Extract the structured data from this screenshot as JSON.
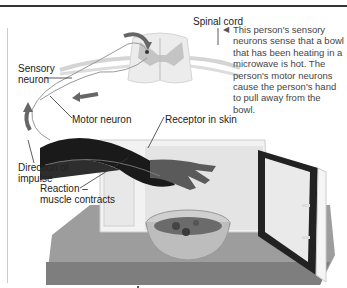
{
  "figure": {
    "labels": {
      "spinal_cord": "Spinal cord",
      "sensory_neuron_1": "Sensory",
      "sensory_neuron_2": "neuron",
      "motor_neuron": "Motor neuron",
      "receptor": "Receptor in skin",
      "direction_1": "Direction of",
      "direction_2": "impulse",
      "reaction_1": "Reaction –",
      "reaction_2": "muscle contracts"
    },
    "caption": {
      "pointer": "◀",
      "text": "This person's sensory neurons sense that a bowl that has been heating in a microwave is hot. The person's motor neurons cause the person's hand to pull away from the bowl."
    },
    "colors": {
      "rule": "#333333",
      "spinal_grey": "#c8c8c8",
      "spinal_white": "#ececec",
      "arrow": "#666666",
      "arm": "#1e1e1e",
      "microwave": "#f0f0f0",
      "counter": "#9a9a9a"
    }
  }
}
